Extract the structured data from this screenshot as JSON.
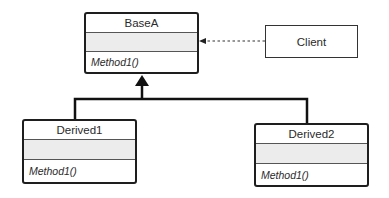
{
  "diagram": {
    "type": "UML class diagram",
    "classes": [
      {
        "name": "BaseA",
        "attributes": [],
        "operations": [
          "Method1()"
        ]
      },
      {
        "name": "Derived1",
        "attributes": [],
        "operations": [
          "Method1()"
        ]
      },
      {
        "name": "Derived2",
        "attributes": [],
        "operations": [
          "Method1()"
        ]
      }
    ],
    "client": {
      "name": "Client"
    },
    "relationships": [
      {
        "from": "Derived1",
        "to": "BaseA",
        "type": "inheritance"
      },
      {
        "from": "Derived2",
        "to": "BaseA",
        "type": "inheritance"
      },
      {
        "from": "Client",
        "to": "BaseA",
        "type": "dependency"
      }
    ]
  }
}
